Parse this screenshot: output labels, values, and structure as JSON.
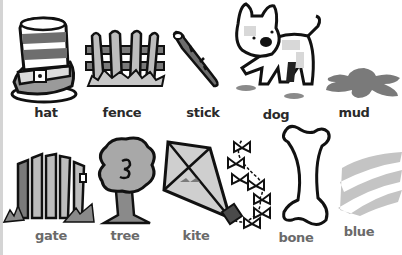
{
  "colors": {
    "outline": "#111111",
    "gray_fill": "#8a8a8a",
    "light_fill": "#cfcfcf",
    "mud": "#7a7a7a",
    "blue_scribble": "#c4c4c4",
    "label_top": "#2a2a2a",
    "label_bottom": "#6a6a6a"
  },
  "rows": [
    {
      "items": [
        {
          "word": "hat",
          "icon": "top-hat-icon"
        },
        {
          "word": "fence",
          "icon": "fence-icon"
        },
        {
          "word": "stick",
          "icon": "stick-icon"
        },
        {
          "word": "dog",
          "icon": "dog-icon"
        },
        {
          "word": "mud",
          "icon": "mud-puddle-icon"
        }
      ]
    },
    {
      "items": [
        {
          "word": "gate",
          "icon": "gate-icon"
        },
        {
          "word": "tree",
          "icon": "tree-icon"
        },
        {
          "word": "kite",
          "icon": "kite-icon"
        },
        {
          "word": "bone",
          "icon": "bone-icon"
        },
        {
          "word": "blue",
          "icon": "blue-scribble-icon"
        }
      ]
    }
  ]
}
